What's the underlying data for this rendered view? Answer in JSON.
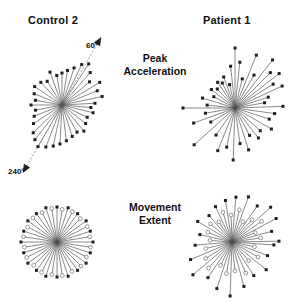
{
  "figure": {
    "background_color": "#ffffff",
    "width": 306,
    "height": 303,
    "columns": [
      {
        "id": "control2",
        "label": "Control 2"
      },
      {
        "id": "patient1",
        "label": "Patient 1"
      }
    ],
    "rows": [
      {
        "id": "peak_acceleration",
        "label": "Peak\nAcceleration",
        "line1": "Peak",
        "line2": "Acceleration"
      },
      {
        "id": "movement_extent",
        "label": "Movement\nExtent",
        "line1": "Movement",
        "line2": "Extent"
      }
    ],
    "reference_arrows": [
      {
        "id": "ref60",
        "label": "60°",
        "angle_deg": 60,
        "style": "dashed-arrow"
      },
      {
        "id": "ref240",
        "label": "240°",
        "angle_deg": 240,
        "style": "dashed-arrow"
      }
    ],
    "marker_legend": [
      {
        "id": "filled",
        "style": "filled-square",
        "color": "#1f1f1f"
      },
      {
        "id": "open",
        "style": "open-circle",
        "color": "#ffffff"
      }
    ]
  },
  "chart_data": [
    {
      "type": "scatter",
      "id": "control2_peak_acceleration",
      "title": "Control 2",
      "subtitle": "Peak Acceleration",
      "plot_kind": "polar-vector",
      "center": [
        62,
        105
      ],
      "radius_unit": "px",
      "xlabel": "",
      "ylabel": "",
      "grid": false,
      "legend": "none",
      "angle_unit": "degrees",
      "reference_angles": [
        60,
        240
      ],
      "points": [
        {
          "angle_deg": 3,
          "r": 33,
          "marker": "filled"
        },
        {
          "angle_deg": 12,
          "r": 41,
          "marker": "filled"
        },
        {
          "angle_deg": 22,
          "r": 38,
          "marker": "filled"
        },
        {
          "angle_deg": 31,
          "r": 44,
          "marker": "filled"
        },
        {
          "angle_deg": 40,
          "r": 36,
          "marker": "filled"
        },
        {
          "angle_deg": 49,
          "r": 43,
          "marker": "filled"
        },
        {
          "angle_deg": 57,
          "r": 49,
          "marker": "filled"
        },
        {
          "angle_deg": 64,
          "r": 45,
          "marker": "filled"
        },
        {
          "angle_deg": 72,
          "r": 39,
          "marker": "filled"
        },
        {
          "angle_deg": 81,
          "r": 35,
          "marker": "filled"
        },
        {
          "angle_deg": 90,
          "r": 32,
          "marker": "filled"
        },
        {
          "angle_deg": 100,
          "r": 30,
          "marker": "filled"
        },
        {
          "angle_deg": 110,
          "r": 35,
          "marker": "filled"
        },
        {
          "angle_deg": 122,
          "r": 28,
          "marker": "filled"
        },
        {
          "angle_deg": 133,
          "r": 31,
          "marker": "filled"
        },
        {
          "angle_deg": 146,
          "r": 33,
          "marker": "filled"
        },
        {
          "angle_deg": 158,
          "r": 30,
          "marker": "filled"
        },
        {
          "angle_deg": 170,
          "r": 27,
          "marker": "filled"
        },
        {
          "angle_deg": 180,
          "r": 31,
          "marker": "filled"
        },
        {
          "angle_deg": 191,
          "r": 27,
          "marker": "filled"
        },
        {
          "angle_deg": 202,
          "r": 30,
          "marker": "filled"
        },
        {
          "angle_deg": 213,
          "r": 34,
          "marker": "filled"
        },
        {
          "angle_deg": 224,
          "r": 40,
          "marker": "filled"
        },
        {
          "angle_deg": 232,
          "r": 44,
          "marker": "filled"
        },
        {
          "angle_deg": 240,
          "r": 48,
          "marker": "filled"
        },
        {
          "angle_deg": 249,
          "r": 45,
          "marker": "filled"
        },
        {
          "angle_deg": 258,
          "r": 42,
          "marker": "filled"
        },
        {
          "angle_deg": 267,
          "r": 39,
          "marker": "filled"
        },
        {
          "angle_deg": 277,
          "r": 36,
          "marker": "filled"
        },
        {
          "angle_deg": 288,
          "r": 33,
          "marker": "filled"
        },
        {
          "angle_deg": 299,
          "r": 31,
          "marker": "filled"
        },
        {
          "angle_deg": 310,
          "r": 34,
          "marker": "filled"
        },
        {
          "angle_deg": 322,
          "r": 30,
          "marker": "filled"
        },
        {
          "angle_deg": 334,
          "r": 28,
          "marker": "filled"
        },
        {
          "angle_deg": 346,
          "r": 32,
          "marker": "filled"
        },
        {
          "angle_deg": 355,
          "r": 29,
          "marker": "filled"
        }
      ]
    },
    {
      "type": "scatter",
      "id": "patient1_peak_acceleration",
      "title": "Patient 1",
      "subtitle": "Peak Acceleration",
      "plot_kind": "polar-vector",
      "center": [
        235,
        108
      ],
      "radius_unit": "px",
      "xlabel": "",
      "ylabel": "",
      "grid": false,
      "legend": "none",
      "angle_unit": "degrees",
      "points": [
        {
          "angle_deg": 2,
          "r": 48,
          "marker": "filled"
        },
        {
          "angle_deg": 10,
          "r": 30,
          "marker": "filled"
        },
        {
          "angle_deg": 18,
          "r": 35,
          "marker": "filled"
        },
        {
          "angle_deg": 25,
          "r": 52,
          "marker": "filled"
        },
        {
          "angle_deg": 32,
          "r": 45,
          "marker": "filled"
        },
        {
          "angle_deg": 38,
          "r": 56,
          "marker": "filled"
        },
        {
          "angle_deg": 45,
          "r": 50,
          "marker": "filled"
        },
        {
          "angle_deg": 52,
          "r": 61,
          "marker": "filled"
        },
        {
          "angle_deg": 60,
          "r": 38,
          "marker": "filled"
        },
        {
          "angle_deg": 68,
          "r": 57,
          "marker": "filled"
        },
        {
          "angle_deg": 76,
          "r": 30,
          "marker": "filled"
        },
        {
          "angle_deg": 84,
          "r": 46,
          "marker": "filled"
        },
        {
          "angle_deg": 90,
          "r": 60,
          "marker": "filled"
        },
        {
          "angle_deg": 96,
          "r": 42,
          "marker": "filled"
        },
        {
          "angle_deg": 103,
          "r": 24,
          "marker": "filled"
        },
        {
          "angle_deg": 110,
          "r": 33,
          "marker": "filled"
        },
        {
          "angle_deg": 117,
          "r": 28,
          "marker": "filled"
        },
        {
          "angle_deg": 124,
          "r": 31,
          "marker": "filled"
        },
        {
          "angle_deg": 133,
          "r": 26,
          "marker": "filled"
        },
        {
          "angle_deg": 142,
          "r": 30,
          "marker": "filled"
        },
        {
          "angle_deg": 152,
          "r": 24,
          "marker": "filled"
        },
        {
          "angle_deg": 163,
          "r": 34,
          "marker": "filled"
        },
        {
          "angle_deg": 174,
          "r": 28,
          "marker": "filled"
        },
        {
          "angle_deg": 180,
          "r": 52,
          "marker": "filled"
        },
        {
          "angle_deg": 190,
          "r": 30,
          "marker": "filled"
        },
        {
          "angle_deg": 200,
          "r": 44,
          "marker": "filled"
        },
        {
          "angle_deg": 210,
          "r": 28,
          "marker": "filled"
        },
        {
          "angle_deg": 222,
          "r": 55,
          "marker": "filled"
        },
        {
          "angle_deg": 235,
          "r": 33,
          "marker": "filled"
        },
        {
          "angle_deg": 248,
          "r": 46,
          "marker": "filled"
        },
        {
          "angle_deg": 258,
          "r": 40,
          "marker": "filled"
        },
        {
          "angle_deg": 268,
          "r": 52,
          "marker": "filled"
        },
        {
          "angle_deg": 278,
          "r": 36,
          "marker": "filled"
        },
        {
          "angle_deg": 288,
          "r": 44,
          "marker": "filled"
        },
        {
          "angle_deg": 298,
          "r": 31,
          "marker": "filled"
        },
        {
          "angle_deg": 308,
          "r": 38,
          "marker": "filled"
        },
        {
          "angle_deg": 318,
          "r": 34,
          "marker": "filled"
        },
        {
          "angle_deg": 330,
          "r": 42,
          "marker": "filled"
        },
        {
          "angle_deg": 342,
          "r": 36,
          "marker": "filled"
        },
        {
          "angle_deg": 352,
          "r": 40,
          "marker": "filled"
        }
      ]
    },
    {
      "type": "scatter",
      "id": "control2_movement_extent",
      "title": "Control 2",
      "subtitle": "Movement Extent",
      "plot_kind": "polar-vector",
      "center": [
        57,
        242
      ],
      "radius_unit": "px",
      "xlabel": "",
      "ylabel": "",
      "grid": false,
      "legend": "none",
      "angle_unit": "degrees",
      "points": [
        {
          "angle_deg": 0,
          "r": 36,
          "marker": "filled"
        },
        {
          "angle_deg": 9,
          "r": 33,
          "marker": "open"
        },
        {
          "angle_deg": 18,
          "r": 35,
          "marker": "filled"
        },
        {
          "angle_deg": 27,
          "r": 34,
          "marker": "open"
        },
        {
          "angle_deg": 36,
          "r": 36,
          "marker": "filled"
        },
        {
          "angle_deg": 45,
          "r": 33,
          "marker": "open"
        },
        {
          "angle_deg": 54,
          "r": 35,
          "marker": "filled"
        },
        {
          "angle_deg": 63,
          "r": 34,
          "marker": "open"
        },
        {
          "angle_deg": 72,
          "r": 36,
          "marker": "filled"
        },
        {
          "angle_deg": 81,
          "r": 33,
          "marker": "open"
        },
        {
          "angle_deg": 90,
          "r": 35,
          "marker": "filled"
        },
        {
          "angle_deg": 99,
          "r": 34,
          "marker": "open"
        },
        {
          "angle_deg": 108,
          "r": 36,
          "marker": "filled"
        },
        {
          "angle_deg": 117,
          "r": 33,
          "marker": "open"
        },
        {
          "angle_deg": 126,
          "r": 35,
          "marker": "filled"
        },
        {
          "angle_deg": 135,
          "r": 34,
          "marker": "open"
        },
        {
          "angle_deg": 144,
          "r": 36,
          "marker": "filled"
        },
        {
          "angle_deg": 153,
          "r": 33,
          "marker": "open"
        },
        {
          "angle_deg": 162,
          "r": 35,
          "marker": "filled"
        },
        {
          "angle_deg": 171,
          "r": 34,
          "marker": "open"
        },
        {
          "angle_deg": 180,
          "r": 36,
          "marker": "filled"
        },
        {
          "angle_deg": 189,
          "r": 33,
          "marker": "open"
        },
        {
          "angle_deg": 198,
          "r": 35,
          "marker": "filled"
        },
        {
          "angle_deg": 207,
          "r": 34,
          "marker": "open"
        },
        {
          "angle_deg": 216,
          "r": 36,
          "marker": "filled"
        },
        {
          "angle_deg": 225,
          "r": 33,
          "marker": "open"
        },
        {
          "angle_deg": 234,
          "r": 35,
          "marker": "filled"
        },
        {
          "angle_deg": 243,
          "r": 34,
          "marker": "open"
        },
        {
          "angle_deg": 252,
          "r": 36,
          "marker": "filled"
        },
        {
          "angle_deg": 261,
          "r": 33,
          "marker": "open"
        },
        {
          "angle_deg": 270,
          "r": 35,
          "marker": "filled"
        },
        {
          "angle_deg": 279,
          "r": 34,
          "marker": "open"
        },
        {
          "angle_deg": 288,
          "r": 36,
          "marker": "filled"
        },
        {
          "angle_deg": 297,
          "r": 33,
          "marker": "open"
        },
        {
          "angle_deg": 306,
          "r": 35,
          "marker": "filled"
        },
        {
          "angle_deg": 315,
          "r": 34,
          "marker": "open"
        },
        {
          "angle_deg": 324,
          "r": 36,
          "marker": "filled"
        },
        {
          "angle_deg": 333,
          "r": 33,
          "marker": "open"
        },
        {
          "angle_deg": 342,
          "r": 35,
          "marker": "filled"
        },
        {
          "angle_deg": 351,
          "r": 34,
          "marker": "open"
        }
      ]
    },
    {
      "type": "scatter",
      "id": "patient1_movement_extent",
      "title": "Patient 1",
      "subtitle": "Movement Extent",
      "plot_kind": "polar-vector",
      "center": [
        232,
        242
      ],
      "radius_unit": "px",
      "xlabel": "",
      "ylabel": "",
      "grid": false,
      "legend": "none",
      "angle_unit": "degrees",
      "points": [
        {
          "angle_deg": 1,
          "r": 47,
          "marker": "filled"
        },
        {
          "angle_deg": 8,
          "r": 29,
          "marker": "open"
        },
        {
          "angle_deg": 15,
          "r": 41,
          "marker": "filled"
        },
        {
          "angle_deg": 22,
          "r": 25,
          "marker": "open"
        },
        {
          "angle_deg": 28,
          "r": 50,
          "marker": "filled"
        },
        {
          "angle_deg": 35,
          "r": 36,
          "marker": "open"
        },
        {
          "angle_deg": 42,
          "r": 52,
          "marker": "filled"
        },
        {
          "angle_deg": 48,
          "r": 30,
          "marker": "open"
        },
        {
          "angle_deg": 55,
          "r": 44,
          "marker": "filled"
        },
        {
          "angle_deg": 62,
          "r": 23,
          "marker": "open"
        },
        {
          "angle_deg": 70,
          "r": 48,
          "marker": "filled"
        },
        {
          "angle_deg": 77,
          "r": 33,
          "marker": "open"
        },
        {
          "angle_deg": 85,
          "r": 45,
          "marker": "filled"
        },
        {
          "angle_deg": 92,
          "r": 27,
          "marker": "open"
        },
        {
          "angle_deg": 99,
          "r": 42,
          "marker": "filled"
        },
        {
          "angle_deg": 107,
          "r": 31,
          "marker": "open"
        },
        {
          "angle_deg": 115,
          "r": 39,
          "marker": "filled"
        },
        {
          "angle_deg": 123,
          "r": 24,
          "marker": "open"
        },
        {
          "angle_deg": 131,
          "r": 35,
          "marker": "filled"
        },
        {
          "angle_deg": 140,
          "r": 28,
          "marker": "open"
        },
        {
          "angle_deg": 149,
          "r": 40,
          "marker": "filled"
        },
        {
          "angle_deg": 158,
          "r": 26,
          "marker": "open"
        },
        {
          "angle_deg": 167,
          "r": 33,
          "marker": "filled"
        },
        {
          "angle_deg": 176,
          "r": 22,
          "marker": "open"
        },
        {
          "angle_deg": 185,
          "r": 37,
          "marker": "filled"
        },
        {
          "angle_deg": 194,
          "r": 27,
          "marker": "open"
        },
        {
          "angle_deg": 203,
          "r": 45,
          "marker": "filled"
        },
        {
          "angle_deg": 212,
          "r": 31,
          "marker": "open"
        },
        {
          "angle_deg": 220,
          "r": 51,
          "marker": "filled"
        },
        {
          "angle_deg": 228,
          "r": 35,
          "marker": "open"
        },
        {
          "angle_deg": 236,
          "r": 43,
          "marker": "filled"
        },
        {
          "angle_deg": 244,
          "r": 26,
          "marker": "open"
        },
        {
          "angle_deg": 252,
          "r": 49,
          "marker": "filled"
        },
        {
          "angle_deg": 260,
          "r": 32,
          "marker": "open"
        },
        {
          "angle_deg": 268,
          "r": 54,
          "marker": "filled"
        },
        {
          "angle_deg": 276,
          "r": 29,
          "marker": "open"
        },
        {
          "angle_deg": 285,
          "r": 46,
          "marker": "filled"
        },
        {
          "angle_deg": 294,
          "r": 34,
          "marker": "open"
        },
        {
          "angle_deg": 303,
          "r": 40,
          "marker": "filled"
        },
        {
          "angle_deg": 312,
          "r": 25,
          "marker": "open"
        },
        {
          "angle_deg": 321,
          "r": 44,
          "marker": "filled"
        },
        {
          "angle_deg": 330,
          "r": 30,
          "marker": "open"
        },
        {
          "angle_deg": 339,
          "r": 38,
          "marker": "filled"
        },
        {
          "angle_deg": 348,
          "r": 23,
          "marker": "open"
        },
        {
          "angle_deg": 356,
          "r": 42,
          "marker": "filled"
        }
      ]
    }
  ]
}
